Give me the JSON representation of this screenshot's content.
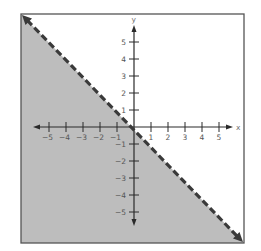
{
  "chart_data": {
    "type": "area",
    "title": "",
    "xlabel": "x",
    "ylabel": "y",
    "xlim": [
      -5.5,
      5.5
    ],
    "ylim": [
      -5.5,
      5.5
    ],
    "x_ticks": [
      -5,
      -4,
      -3,
      -2,
      -1,
      1,
      2,
      3,
      4,
      5
    ],
    "y_ticks": [
      -5,
      -4,
      -3,
      -2,
      -1,
      1,
      2,
      3,
      4,
      5
    ],
    "x_tick_labels": [
      "-5",
      "-4",
      "-3",
      "-2",
      "-1",
      "1",
      "2",
      "3",
      "4",
      "5"
    ],
    "y_tick_labels": [
      "-5",
      "-4",
      "-3",
      "-2",
      "-1",
      "1",
      "2",
      "3",
      "4",
      "5"
    ],
    "grid": false,
    "legend": null,
    "boundary_line": {
      "equation": "y = -x",
      "style": "dashed",
      "slope": -1,
      "intercept": 0,
      "points": [
        [
          -6.5,
          6.5
        ],
        [
          6.5,
          -6.5
        ]
      ],
      "arrows": "both"
    },
    "shaded_region": {
      "side": "below",
      "inequality": "y < -x",
      "color": "#bdbdbd"
    }
  },
  "colors": {
    "shade": "#bdbdbd",
    "line": "#3a3a3a",
    "axis": "#2a2a2a",
    "frame": "#555555"
  }
}
